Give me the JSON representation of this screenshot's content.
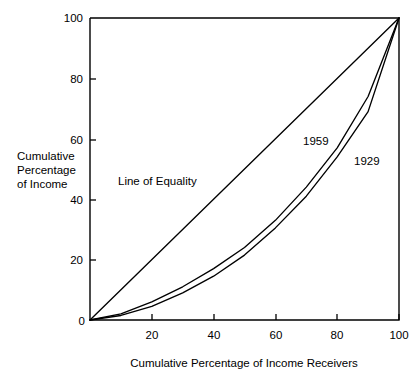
{
  "chart_data": {
    "type": "line",
    "title": "",
    "xlabel": "Cumulative Percentage of Income Receivers",
    "ylabel": "Cumulative Percentage of Income",
    "ylabel_lines": [
      "Cumulative",
      "Percentage",
      "of Income"
    ],
    "xlim": [
      0,
      100
    ],
    "ylim": [
      0,
      100
    ],
    "xticks": [
      0,
      20,
      40,
      60,
      80,
      100
    ],
    "yticks": [
      0,
      20,
      40,
      60,
      80,
      100
    ],
    "xtick_labels": [
      "0",
      "20",
      "40",
      "60",
      "80",
      "100"
    ],
    "ytick_labels": [
      "0",
      "20",
      "40",
      "60",
      "80",
      "100"
    ],
    "grid": false,
    "legend": "inline-annotations",
    "series": [
      {
        "name": "Line of Equality",
        "label": "Line of Equality",
        "x": [
          0,
          100
        ],
        "values": [
          0,
          100
        ]
      },
      {
        "name": "1959",
        "label": "1959",
        "x": [
          0,
          10,
          20,
          30,
          40,
          50,
          60,
          70,
          80,
          90,
          100
        ],
        "values": [
          0,
          2,
          6,
          11,
          17,
          24,
          33,
          44,
          57,
          74,
          100
        ]
      },
      {
        "name": "1929",
        "label": "1929",
        "x": [
          0,
          10,
          20,
          30,
          40,
          50,
          60,
          70,
          80,
          90,
          100
        ],
        "values": [
          0,
          1.5,
          4.5,
          9,
          14.5,
          21.5,
          30.5,
          41,
          54,
          69,
          100
        ]
      }
    ],
    "annotations": [
      {
        "text": "Line of Equality",
        "x": 30,
        "y": 47
      },
      {
        "text": "1959",
        "x": 70,
        "y": 57
      },
      {
        "text": "1929",
        "x": 82,
        "y": 49
      }
    ],
    "colors": {
      "line": "#000000",
      "background": "#ffffff",
      "text": "#000000"
    }
  },
  "axis_titles": {
    "x": "Cumulative Percentage of Income Receivers",
    "y_line_1": "Cumulative",
    "y_line_2": "Percentage",
    "y_line_3": "of Income"
  },
  "tick_text": {
    "y100": "100",
    "y80": "80",
    "y60": "60",
    "y40": "40",
    "y20": "20",
    "y0": "0",
    "x20": "20",
    "x40": "40",
    "x60": "60",
    "x80": "80",
    "x100": "100"
  },
  "curve_labels": {
    "equality": "Line of Equality",
    "year_1959": "1959",
    "year_1929": "1929"
  }
}
